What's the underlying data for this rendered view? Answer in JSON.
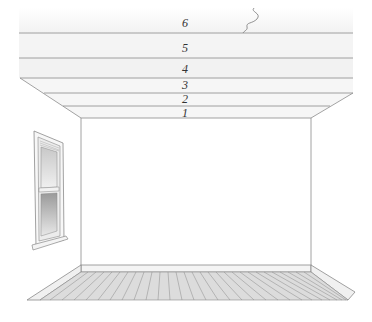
{
  "diagram": {
    "type": "room-ceiling-layers",
    "layers": [
      {
        "id": 6,
        "label": "6"
      },
      {
        "id": 5,
        "label": "5"
      },
      {
        "id": 4,
        "label": "4"
      },
      {
        "id": 3,
        "label": "3"
      },
      {
        "id": 2,
        "label": "2"
      },
      {
        "id": 1,
        "label": "1"
      }
    ],
    "elements": [
      "ceiling-layers",
      "back-wall",
      "left-wall-window",
      "wood-floor",
      "baseboard",
      "wavy-break-line"
    ],
    "colors": {
      "line": "#8a8a8a",
      "ceiling_fill": "#f3f3f3",
      "floor_fill": "#d8d8d8",
      "window_glass": "#b9b9b9"
    }
  }
}
